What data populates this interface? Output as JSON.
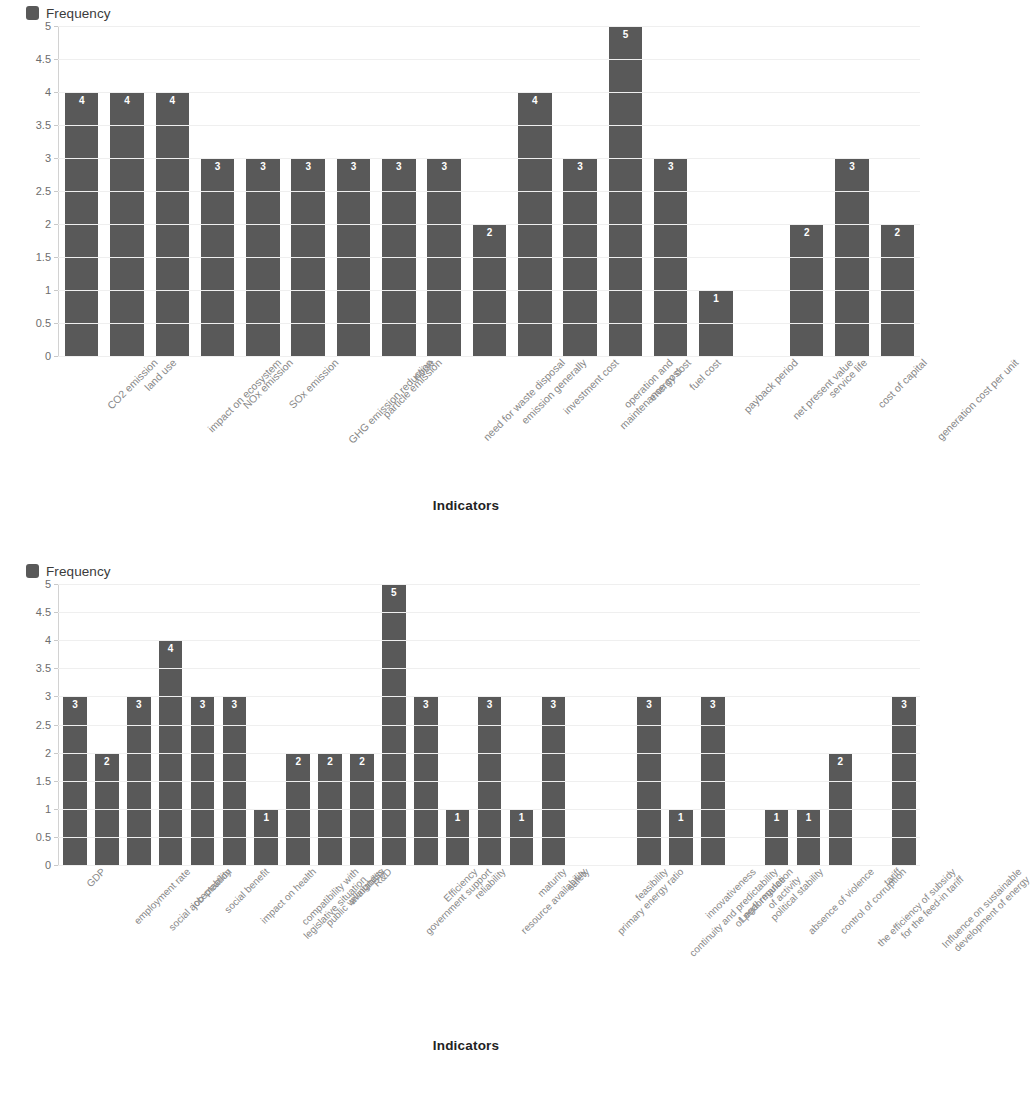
{
  "page": {
    "background": "#ffffff",
    "bar_color": "#595959",
    "grid_color": "#efefef",
    "label_color": "#888888"
  },
  "charts": [
    {
      "id": "chart-1",
      "legend": {
        "label": "Frequency",
        "swatch_color": "#595959",
        "icon": "square-swatch-icon"
      },
      "axis_title": "Indicators",
      "y_ticks": [
        "5",
        "4.5",
        "4",
        "3.5",
        "3",
        "2.5",
        "2",
        "1.5",
        "1",
        "0.5",
        "0"
      ],
      "chart_data": {
        "type": "bar",
        "title": "",
        "subtitle": "",
        "xlabel": "Indicators",
        "ylabel": "",
        "ylim": [
          0,
          5
        ],
        "ytick_step": 0.5,
        "grid": true,
        "legend_position": "top-left",
        "series": [
          {
            "name": "Frequency",
            "color": "#595959",
            "values": [
              4,
              4,
              4,
              3,
              3,
              3,
              3,
              3,
              3,
              2,
              4,
              3,
              5,
              3,
              1,
              0,
              2,
              3,
              2
            ]
          }
        ],
        "categories": [
          "CO2 emission",
          "land use",
          "impact on ecosystem",
          "NOx emission",
          "SOx emission",
          "GHG emission reduction",
          "particle emission",
          "noise",
          "need for waste disposal",
          "emission generally",
          "investment cost",
          "operation and maintenance cost",
          "energy cost",
          "fuel cost",
          "payback period",
          "net present value",
          "service life",
          "cost of capital",
          "generation cost per unit"
        ],
        "data_labels": [
          "4",
          "4",
          "4",
          "3",
          "3",
          "3",
          "3",
          "3",
          "3",
          "2",
          "4",
          "3",
          "5",
          "3",
          "1",
          "",
          "2",
          "3",
          "2"
        ]
      }
    },
    {
      "id": "chart-2",
      "legend": {
        "label": "Frequency",
        "swatch_color": "#595959",
        "icon": "square-swatch-icon"
      },
      "axis_title": "Indicators",
      "y_ticks": [
        "5",
        "4.5",
        "4",
        "3.5",
        "3",
        "2.5",
        "2",
        "1.5",
        "1",
        "0.5",
        "0"
      ],
      "chart_data": {
        "type": "bar",
        "title": "",
        "subtitle": "",
        "xlabel": "Indicators",
        "ylabel": "",
        "ylim": [
          0,
          5
        ],
        "ytick_step": 0.5,
        "grid": true,
        "legend_position": "top-left",
        "series": [
          {
            "name": "Frequency",
            "color": "#595959",
            "values": [
              3,
              2,
              3,
              4,
              3,
              3,
              1,
              2,
              2,
              2,
              5,
              3,
              1,
              3,
              1,
              3,
              0,
              0,
              3,
              1,
              3,
              0,
              1,
              1,
              2,
              0,
              3
            ]
          }
        ],
        "categories": [
          "GDP",
          "employment rate",
          "social acceptability",
          "job creation",
          "social benefit",
          "impact on health",
          "compatibility with legislative situation",
          "public willingness",
          "availability",
          "R&D",
          "government support",
          "Efficiency",
          "reliability",
          "resource availability",
          "maturity",
          "safety",
          "primary energy ratio",
          "feasibility",
          "continuity and predictability of performance",
          "innovativeness",
          "Legal regulation of activity",
          "political stability",
          "absence of violence",
          "control of corruption",
          "the efficiency of subsidy for the feed-in tariff",
          "tariff",
          "Influence on sustainable development of energy"
        ],
        "data_labels": [
          "3",
          "2",
          "3",
          "4",
          "3",
          "3",
          "1",
          "2",
          "2",
          "2",
          "5",
          "3",
          "1",
          "3",
          "1",
          "3",
          "",
          "",
          "3",
          "1",
          "3",
          "",
          "1",
          "1",
          "2",
          "",
          "3"
        ]
      }
    }
  ]
}
